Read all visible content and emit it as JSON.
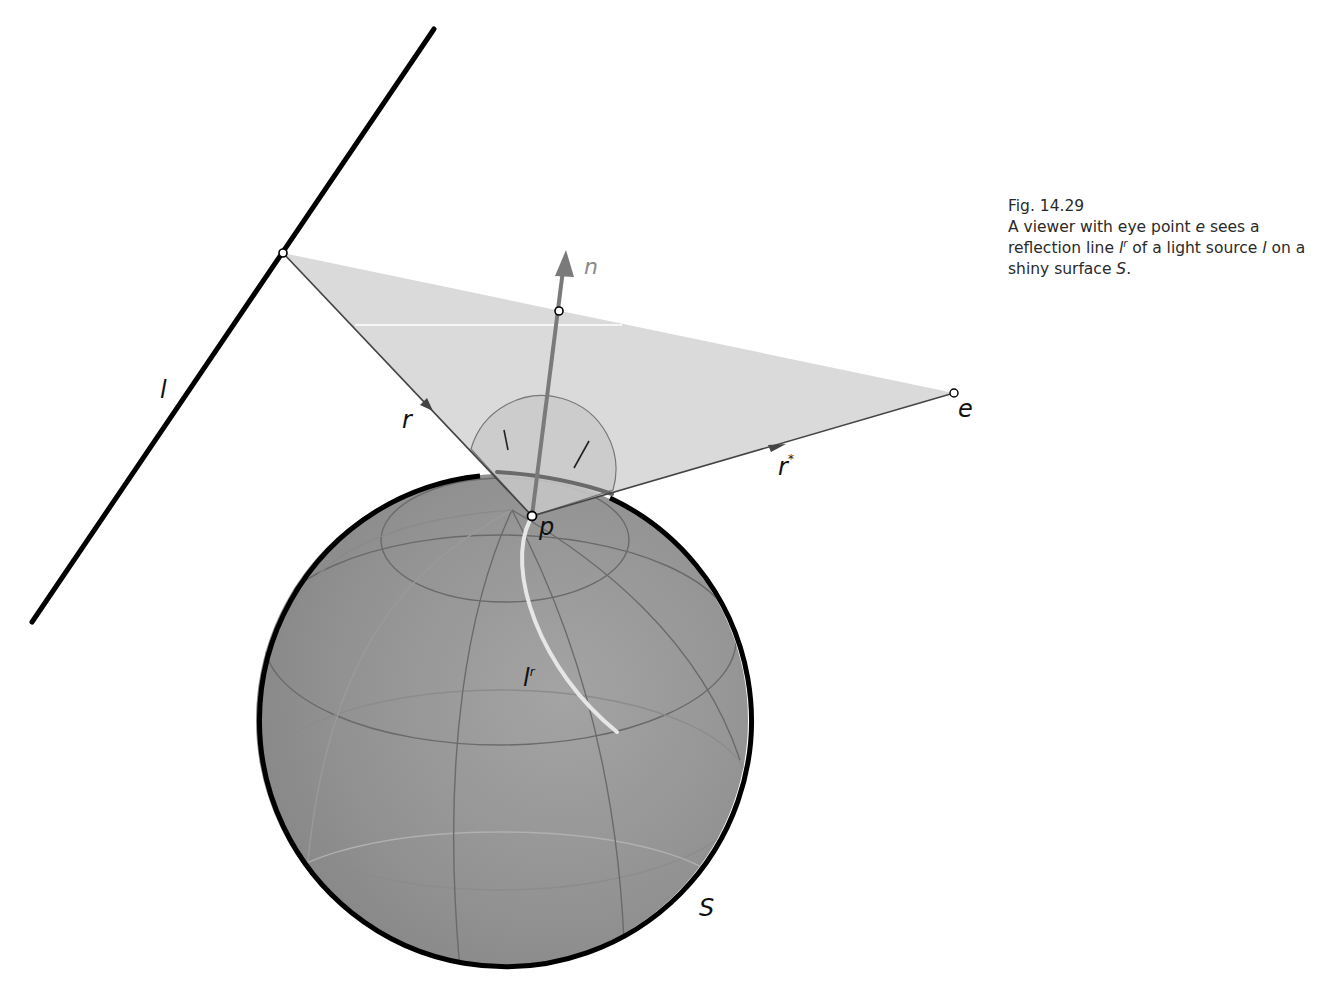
{
  "caption": {
    "figure_number": "Fig. 14.29",
    "text_parts": {
      "p1": "A viewer with eye point ",
      "e": "e",
      "p2": " sees a reflection line ",
      "l": "l",
      "r_sup": "r",
      "p3": " of a light source ",
      "l2": "l",
      "p4": " on a shiny surface ",
      "S": "S",
      "p5": "."
    }
  },
  "labels": {
    "light_line": "l",
    "normal": "n",
    "eye_point": "e",
    "incident_ray": "r",
    "reflected_ray": "r",
    "reflected_ray_sup": "*",
    "surface_point": "p",
    "reflection_line": "l",
    "reflection_line_sup": "r",
    "surface": "S"
  },
  "colors": {
    "sphere_fill": "#8f8f8f",
    "sphere_outline": "#000000",
    "plane_fill": "#d9d9d9",
    "normal_arrow": "#7a7a7a",
    "reflection_line": "#e6e6e6",
    "grid_lines": "#6a6a6a"
  }
}
